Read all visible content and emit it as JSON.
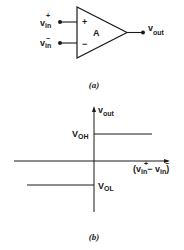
{
  "figure_a": {
    "caption": "(a)",
    "amp_label": "A",
    "plus_sign": "+",
    "minus_sign": "−",
    "input_pos": {
      "base": "v",
      "sub": "in",
      "sup": "+"
    },
    "input_neg": {
      "base": "v",
      "sub": "in",
      "sup": "−"
    },
    "output": {
      "base": "v",
      "sub": "out"
    }
  },
  "figure_b": {
    "caption": "(b)",
    "y_axis": {
      "base": "v",
      "sub": "out"
    },
    "x_axis": {
      "open": "(v",
      "sub1": "in",
      "sup1": "+",
      "mid": "− v",
      "sub2": "in",
      "sup2": "−",
      "close": ")"
    },
    "voh": {
      "base": "V",
      "sub": "OH"
    },
    "vol": {
      "base": "V",
      "sub": "OL"
    }
  },
  "colors": {
    "stroke": "#1a1a1a",
    "background": "#ffffff"
  }
}
